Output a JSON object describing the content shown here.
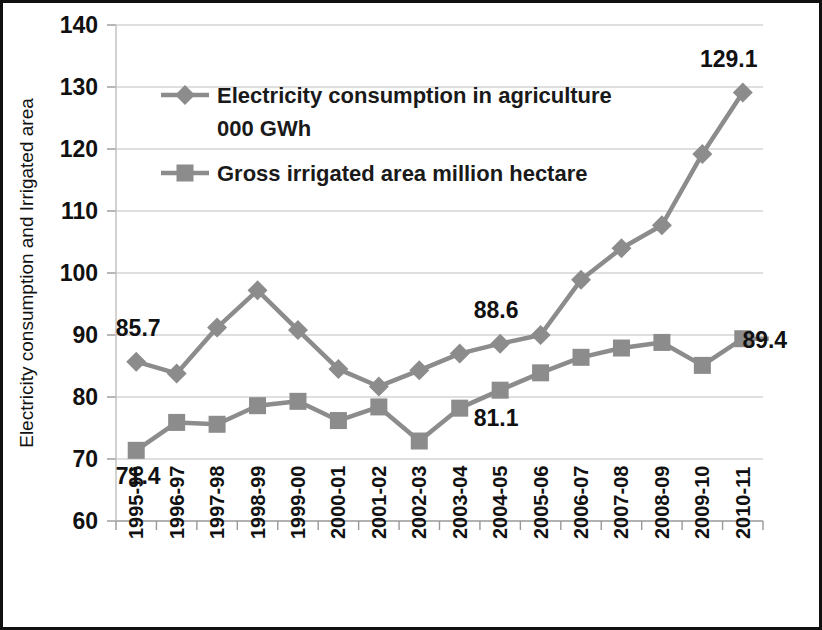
{
  "chart_data": {
    "type": "line",
    "title": "",
    "xlabel": "",
    "ylabel": "Electricity consumption and Irrigated area",
    "ylim": [
      60,
      140
    ],
    "ytick_step": 10,
    "yticks": [
      60,
      70,
      80,
      90,
      100,
      110,
      120,
      130,
      140
    ],
    "grid": true,
    "legend_position": "inside-top-left",
    "categories": [
      "1995-96",
      "1996-97",
      "1997-98",
      "1998-99",
      "1999-00",
      "2000-01",
      "2001-02",
      "2002-03",
      "2003-04",
      "2004-05",
      "2005-06",
      "2006-07",
      "2007-08",
      "2008-09",
      "2009-10",
      "2010-11"
    ],
    "series": [
      {
        "name": "Electricity consumption in agriculture 000 GWh",
        "marker": "diamond",
        "color": "#8c8c8c",
        "values": [
          85.7,
          83.8,
          91.2,
          97.2,
          90.8,
          84.5,
          81.7,
          84.3,
          87.0,
          88.6,
          90.0,
          98.9,
          104.0,
          107.7,
          119.2,
          129.1
        ]
      },
      {
        "name": "Gross irrigated area million hectare",
        "marker": "square",
        "color": "#8c8c8c",
        "values": [
          71.4,
          75.9,
          75.6,
          78.6,
          79.3,
          76.2,
          78.4,
          72.9,
          78.2,
          81.1,
          83.9,
          86.4,
          87.9,
          88.8,
          85.1,
          89.4
        ]
      }
    ],
    "point_labels": [
      {
        "text": "85.7",
        "series": 0,
        "index": 0,
        "dx": 2,
        "dy": -26
      },
      {
        "text": "88.6",
        "series": 0,
        "index": 9,
        "dx": -4,
        "dy": -26
      },
      {
        "text": "129.1",
        "series": 0,
        "index": 15,
        "dx": -14,
        "dy": -26
      },
      {
        "text": "71.4",
        "series": 1,
        "index": 0,
        "dx": 2,
        "dy": 34
      },
      {
        "text": "81.1",
        "series": 1,
        "index": 9,
        "dx": -4,
        "dy": 36
      },
      {
        "text": "89.4",
        "series": 1,
        "index": 15,
        "dx": 22,
        "dy": 9
      }
    ],
    "legend": [
      {
        "label_line1": "Electricity consumption in agriculture",
        "label_line2": "000 GWh",
        "marker": "diamond"
      },
      {
        "label_line1": "Gross irrigated area million hectare",
        "label_line2": "",
        "marker": "square"
      }
    ],
    "colors": {
      "series": "#8c8c8c",
      "gridline": "#bfbfbf",
      "axis": "#999999",
      "text": "#111111",
      "border": "#111111"
    }
  }
}
